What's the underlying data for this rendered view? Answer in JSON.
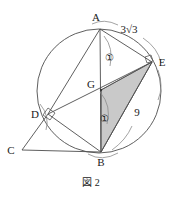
{
  "figure": {
    "caption": "図 2",
    "points": {
      "A": {
        "label": "A",
        "x": 100,
        "y": 29,
        "lx": 96,
        "ly": 21
      },
      "B": {
        "label": "B",
        "x": 101,
        "y": 152,
        "lx": 97,
        "ly": 164
      },
      "C": {
        "label": "C",
        "x": 22,
        "y": 150,
        "lx": 8,
        "ly": 154
      },
      "D": {
        "label": "D",
        "x": 48,
        "y": 114,
        "lx": 32,
        "ly": 118
      },
      "E": {
        "label": "E",
        "x": 152,
        "y": 62,
        "lx": 158,
        "ly": 66
      },
      "G": {
        "label": "G",
        "x": 101,
        "y": 90,
        "lx": 88,
        "ly": 88
      }
    },
    "circle": {
      "cx": 99,
      "cy": 91,
      "r": 62
    },
    "length_labels": [
      {
        "name": "label-3root3",
        "text": "3√3",
        "x": 122,
        "y": 33
      },
      {
        "name": "label-9",
        "text": "9",
        "x": 137,
        "y": 113
      }
    ],
    "circled_numbers": [
      {
        "name": "circled-one-upper",
        "text": "①",
        "x": 109,
        "y": 58
      },
      {
        "name": "circled-one-lower",
        "text": "①",
        "x": 104,
        "y": 119
      }
    ],
    "right_angle_marks": [
      {
        "name": "right-angle-at-d",
        "at": "D"
      },
      {
        "name": "right-angle-at-e",
        "at": "E"
      }
    ],
    "colors": {
      "shaded_triangle_fill": "#c9c9c9",
      "line": "#4d4d4d",
      "arc": "#8c8c8c",
      "text": "#1a1a1a",
      "background": "#ffffff"
    },
    "shaded_triangle": "G-E-B"
  }
}
